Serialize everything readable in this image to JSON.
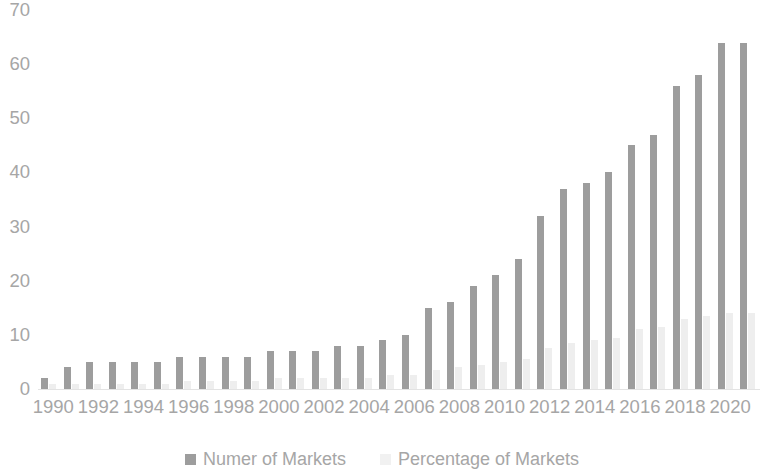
{
  "chart_data": {
    "type": "bar",
    "title": "",
    "subtitle": "",
    "xlabel": "",
    "ylabel": "",
    "ylim": [
      0,
      70
    ],
    "ytick_step": 10,
    "yticks": [
      "0",
      "10",
      "20",
      "30",
      "40",
      "50",
      "60",
      "70"
    ],
    "grid": false,
    "legend_position": "bottom",
    "categories": [
      "1990",
      "1991",
      "1992",
      "1993",
      "1994",
      "1995",
      "1996",
      "1997",
      "1998",
      "1999",
      "2000",
      "2001",
      "2002",
      "2003",
      "2004",
      "2005",
      "2006",
      "2007",
      "2008",
      "2009",
      "2010",
      "2011",
      "2012",
      "2013",
      "2014",
      "2015",
      "2016",
      "2017",
      "2018",
      "2019",
      "2020",
      "2021"
    ],
    "xtick_labels": [
      "1990",
      "1992",
      "1994",
      "1996",
      "1998",
      "2000",
      "2002",
      "2004",
      "2006",
      "2008",
      "2010",
      "2012",
      "2014",
      "2016",
      "2018",
      "2020"
    ],
    "series": [
      {
        "name": "Numer of Markets",
        "color": "#9d9d9d",
        "values": [
          2,
          4,
          5,
          5,
          5,
          5,
          6,
          6,
          6,
          6,
          7,
          7,
          7,
          8,
          8,
          9,
          10,
          15,
          16,
          19,
          21,
          24,
          32,
          37,
          38,
          40,
          45,
          47,
          56,
          58,
          64,
          64
        ]
      },
      {
        "name": "Percentage of Markets",
        "color": "#eeeeee",
        "values": [
          1,
          1,
          1,
          1,
          1,
          1,
          1.5,
          1.5,
          1.5,
          1.5,
          2,
          2,
          2,
          2,
          2,
          2.5,
          2.5,
          3.5,
          4,
          4.5,
          5,
          5.5,
          7.5,
          8.5,
          9,
          9.5,
          11,
          11.5,
          13,
          13.5,
          14,
          14
        ]
      }
    ]
  },
  "legend": {
    "items": [
      {
        "label": "Numer of Markets",
        "swatch": "dark"
      },
      {
        "label": "Percentage of Markets",
        "swatch": "light"
      }
    ]
  }
}
